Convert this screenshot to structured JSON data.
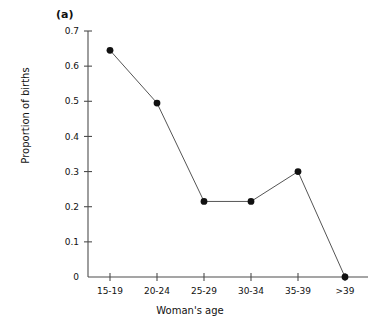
{
  "chart_data": {
    "type": "line",
    "title": "",
    "panel_label": "(a)",
    "xlabel": "Woman's age",
    "ylabel": "Proportion of births",
    "categories": [
      "15-19",
      "20-24",
      "25-29",
      "30-34",
      "35-39",
      ">39"
    ],
    "values": [
      0.645,
      0.495,
      0.215,
      0.215,
      0.3,
      0.0
    ],
    "ylim": [
      0,
      0.7
    ],
    "yticks": [
      0,
      0.1,
      0.2,
      0.3,
      0.4,
      0.5,
      0.6,
      0.7
    ],
    "ytick_labels": [
      "0",
      "0.1",
      "0.2",
      "0.3",
      "0.4",
      "0.5",
      "0.6",
      "0.7"
    ],
    "grid": false,
    "legend": false,
    "marker": "filled-circle",
    "marker_color": "#111111",
    "line_color": "#555555",
    "axis_color": "#4d4d4d",
    "background": "#ffffff"
  }
}
